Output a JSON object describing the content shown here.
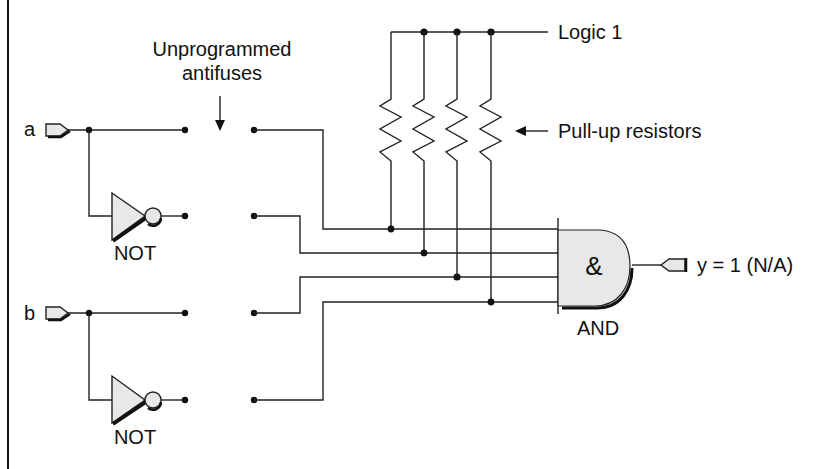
{
  "diagram": {
    "title_annotation": {
      "line1": "Unprogrammed",
      "line2": "antifuses"
    },
    "logic1_label": "Logic 1",
    "pullup_label": "Pull-up resistors",
    "inputs": [
      {
        "name": "a"
      },
      {
        "name": "b"
      }
    ],
    "gates": {
      "not_a_label": "NOT",
      "not_b_label": "NOT",
      "and_label": "AND",
      "and_symbol": "&"
    },
    "output": {
      "label": "y = 1 (N/A)"
    },
    "colors": {
      "line": "#222222",
      "gate_fill": "#e8e8e8",
      "background": "#ffffff"
    }
  }
}
